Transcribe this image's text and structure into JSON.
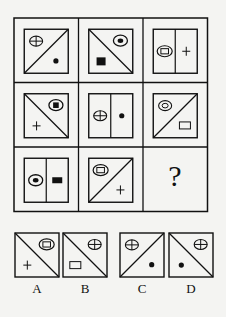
{
  "puzzle": {
    "grid": {
      "x": 14,
      "y": 18,
      "cell": 64.5,
      "rows": 3,
      "cols": 3,
      "cells": [
        {
          "row": 0,
          "col": 0,
          "divider": "diag-up",
          "items": [
            {
              "shape": "circle-cross",
              "pos": "tl"
            },
            {
              "shape": "dot",
              "pos": "br"
            }
          ]
        },
        {
          "row": 0,
          "col": 1,
          "divider": "diag-down",
          "items": [
            {
              "shape": "ellipse-dot",
              "pos": "tr"
            },
            {
              "shape": "filled-square",
              "pos": "bl"
            }
          ]
        },
        {
          "row": 0,
          "col": 2,
          "divider": "vertical",
          "items": [
            {
              "shape": "ellipse-rect",
              "pos": "l"
            },
            {
              "shape": "plus",
              "pos": "r"
            }
          ]
        },
        {
          "row": 1,
          "col": 0,
          "divider": "diag-down",
          "items": [
            {
              "shape": "ellipse-square",
              "pos": "tr"
            },
            {
              "shape": "plus",
              "pos": "bl"
            }
          ]
        },
        {
          "row": 1,
          "col": 1,
          "divider": "vertical",
          "items": [
            {
              "shape": "circle-cross",
              "pos": "l"
            },
            {
              "shape": "dot",
              "pos": "r"
            }
          ]
        },
        {
          "row": 1,
          "col": 2,
          "divider": "diag-up",
          "items": [
            {
              "shape": "ellipse-ring",
              "pos": "tl"
            },
            {
              "shape": "rect",
              "pos": "br"
            }
          ]
        },
        {
          "row": 2,
          "col": 0,
          "divider": "vertical",
          "items": [
            {
              "shape": "ellipse-dot",
              "pos": "l"
            },
            {
              "shape": "filled-rect",
              "pos": "r"
            }
          ]
        },
        {
          "row": 2,
          "col": 1,
          "divider": "diag-up",
          "items": [
            {
              "shape": "ellipse-rect",
              "pos": "tl"
            },
            {
              "shape": "plus",
              "pos": "br"
            }
          ]
        },
        {
          "row": 2,
          "col": 2,
          "question": true
        }
      ],
      "question_mark": "?"
    },
    "options": [
      {
        "label": "A",
        "x": 15,
        "divider": "diag-down",
        "items": [
          {
            "shape": "ellipse-rect",
            "pos": "tr"
          },
          {
            "shape": "plus",
            "pos": "bl"
          }
        ]
      },
      {
        "label": "B",
        "x": 63,
        "divider": "diag-down",
        "items": [
          {
            "shape": "circle-cross",
            "pos": "tr"
          },
          {
            "shape": "rect",
            "pos": "bl"
          }
        ]
      },
      {
        "label": "C",
        "x": 120,
        "divider": "diag-up",
        "items": [
          {
            "shape": "circle-cross",
            "pos": "tl"
          },
          {
            "shape": "dot",
            "pos": "br"
          }
        ]
      },
      {
        "label": "D",
        "x": 169,
        "divider": "diag-down",
        "items": [
          {
            "shape": "circle-cross",
            "pos": "tr"
          },
          {
            "shape": "dot",
            "pos": "bl"
          }
        ]
      }
    ],
    "option_box": {
      "y": 233,
      "size": 44
    },
    "colors": {
      "stroke": "#111111",
      "background": "#f4f4f2"
    }
  }
}
